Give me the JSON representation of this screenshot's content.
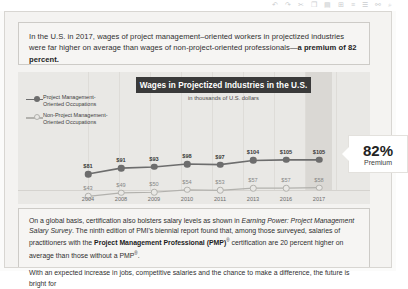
{
  "toolbar": {
    "icons": [
      "undo-icon",
      "redo-icon",
      "cut-icon",
      "copy-icon",
      "paste-icon",
      "format-icon",
      "align-icon",
      "list-icon",
      "link-icon",
      "zoom-icon"
    ]
  },
  "intro": {
    "text_1": "In the U.S. in 2017, wages of project management–oriented workers in projectized industries were far higher on average than wages of non-project-oriented professionals—",
    "text_bold": "a premium of 82 percent."
  },
  "chart_data": {
    "type": "line",
    "title": "Wages in Projectized Industries in the U.S.",
    "subtitle": "in thousands of U.S. dollars",
    "xlabel": "",
    "ylabel": "",
    "categories": [
      "2004",
      "2008",
      "2009",
      "2010",
      "2011",
      "2013",
      "2016",
      "2017"
    ],
    "series": [
      {
        "name": "Project Management-Oriented Occupations",
        "color": "#6d6d6d",
        "labels": [
          "$81",
          "$91",
          "$93",
          "$98",
          "$97",
          "$104",
          "$105",
          "$105"
        ],
        "values": [
          81,
          91,
          93,
          98,
          97,
          104,
          105,
          105
        ]
      },
      {
        "name": "Non-Project Management-Oriented Occupations",
        "color": "#b2b1ad",
        "labels": [
          "$43",
          "$49",
          "$50",
          "$54",
          "$53",
          "$57",
          "$57",
          "$58"
        ],
        "values": [
          43,
          49,
          50,
          54,
          53,
          57,
          57,
          58
        ]
      }
    ],
    "ylim": [
      30,
      115
    ],
    "grid": true,
    "legend_position": "left",
    "highlight_category": "2017",
    "annotation": {
      "value": "82%",
      "label": "Premium"
    }
  },
  "legend": {
    "items": [
      {
        "line_1": "Project Management-",
        "line_2": "Oriented Occupations"
      },
      {
        "line_1": "Non-Project Management-",
        "line_2": "Oriented Occupations"
      }
    ]
  },
  "callout": {
    "percent": "82%",
    "label": "Premium"
  },
  "body": {
    "para1_a": "On a global basis, certification also bolsters salary levels as shown in ",
    "para1_italic": "Earning Power: Project Management Salary Survey",
    "para1_b": ". The ninth edition of PMI's biennial report found that, among those surveyed, salaries of practitioners with the ",
    "para1_bold": "Project Management Professional (PMP)",
    "para1_sup": "®",
    "para1_c": " certification are 20 percent higher on average than those without a PMP",
    "para1_sup2": "®",
    "para1_d": ".",
    "para2": "With an expected increase in jobs, competitive salaries and the chance to make a difference, the future is bright for"
  }
}
